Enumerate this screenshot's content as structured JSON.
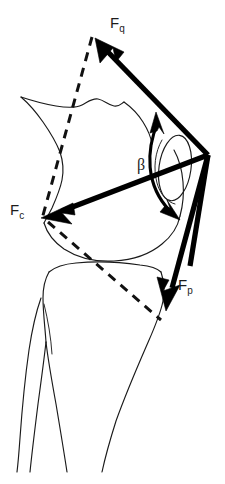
{
  "figure": {
    "background_color": "#ffffff",
    "stroke_color": "#000000",
    "bone_outline_color": "#1a1a1a",
    "width_px": 225,
    "height_px": 484
  },
  "labels": {
    "fq": {
      "base": "F",
      "sub": "q",
      "name": "quadriceps-force"
    },
    "fc": {
      "base": "F",
      "sub": "c",
      "name": "compression-force"
    },
    "fp": {
      "base": "F",
      "sub": "p",
      "name": "patellar-tendon-force"
    },
    "beta": {
      "symbol": "β",
      "name": "beta-angle"
    }
  },
  "vectors": [
    {
      "id": "fq",
      "label": "Fq",
      "description": "quadriceps tendon force, directed superiorly and anteriorly",
      "from": [
        208,
        155
      ],
      "to": [
        95,
        38
      ],
      "style": "solid-thick-arrow"
    },
    {
      "id": "fc",
      "label": "Fc",
      "description": "resultant patellofemoral joint compression force, directed posteriorly and inferiorly",
      "from": [
        208,
        155
      ],
      "to": [
        41,
        218
      ],
      "style": "solid-thick-arrow"
    },
    {
      "id": "fp",
      "label": "Fp",
      "description": "patellar tendon force, directed inferiorly toward tibial tuberosity",
      "from": [
        208,
        155
      ],
      "to": [
        166,
        311
      ],
      "style": "solid-thick-arrow"
    }
  ],
  "angle": {
    "id": "beta",
    "symbol": "β",
    "description": "angle between quadriceps force and patellar tendon force",
    "arc_start": [
      156,
      116
    ],
    "arc_end": [
      176,
      217
    ],
    "double_headed": true
  },
  "reference_axes": [
    {
      "id": "femoral-axis",
      "description": "dashed femoral shaft long axis",
      "from": [
        92,
        37
      ],
      "to": [
        42,
        219
      ]
    },
    {
      "id": "tibial-reference",
      "description": "dashed line from joint line to tibial tuberosity",
      "from": [
        48,
        222
      ],
      "to": [
        161,
        320
      ]
    }
  ],
  "anatomy": [
    {
      "id": "femur-shaft",
      "name": "femur-shaft-outline"
    },
    {
      "id": "femoral-condyle",
      "name": "femoral-condyle-outline"
    },
    {
      "id": "patella",
      "name": "patella-outline"
    },
    {
      "id": "tibial-plateau",
      "name": "tibial-plateau-outline"
    },
    {
      "id": "tibia-shaft",
      "name": "tibia-shaft-outline"
    },
    {
      "id": "fibula",
      "name": "fibula-outline"
    }
  ],
  "caption": {
    "text": ""
  }
}
